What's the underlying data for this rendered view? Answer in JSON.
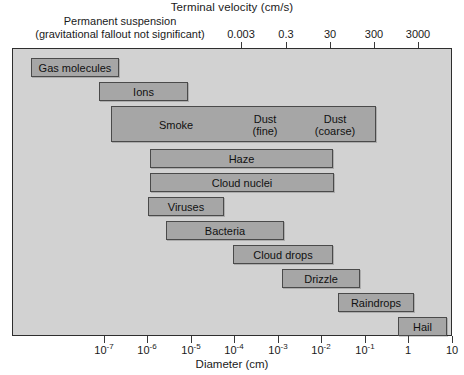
{
  "chart_data": {
    "type": "bar",
    "title": "Terminal velocity (cm/s)",
    "subtitle": "Permanent suspension (gravitational fallout not significant)",
    "xlabel": "Diameter (cm)",
    "ylabel": "",
    "orientation": "horizontal-ranges",
    "grid": false,
    "legend": "none",
    "x_axis_bottom": {
      "label": "Diameter (cm)",
      "scale": "log10",
      "range": [
        -7.5,
        10.0
      ],
      "ticks": [
        {
          "value": 1e-07,
          "label": "10",
          "exponent": "-7"
        },
        {
          "value": 1e-06,
          "label": "10",
          "exponent": "-6"
        },
        {
          "value": 1e-05,
          "label": "10",
          "exponent": "-5"
        },
        {
          "value": 0.0001,
          "label": "10",
          "exponent": "-4"
        },
        {
          "value": 0.001,
          "label": "10",
          "exponent": "-3"
        },
        {
          "value": 0.01,
          "label": "10",
          "exponent": "-2"
        },
        {
          "value": 0.1,
          "label": "10",
          "exponent": "-1"
        },
        {
          "value": 1,
          "label": "1",
          "exponent": ""
        },
        {
          "value": 10,
          "label": "10",
          "exponent": ""
        }
      ]
    },
    "x_axis_top": {
      "label": "Terminal velocity (cm/s)",
      "scale": "log10",
      "ticks": [
        {
          "label": "0.003"
        },
        {
          "label": "0.3"
        },
        {
          "label": "30"
        },
        {
          "label": "300"
        },
        {
          "label": "3000"
        }
      ]
    },
    "categories": [
      "Gas molecules",
      "Ions",
      "Smoke / Dust (fine) / Dust (coarse)",
      "Haze",
      "Cloud nuclei",
      "Viruses",
      "Bacteria",
      "Cloud drops",
      "Drizzle",
      "Raindrops",
      "Hail"
    ],
    "bars": [
      {
        "label": "Gas molecules",
        "d_min": 1e-08,
        "d_max": 4e-07,
        "row": 0
      },
      {
        "label": "Ions",
        "d_min": 2.4e-07,
        "d_max": 1e-05,
        "row": 1
      },
      {
        "label": "Smoke",
        "d_min": 5e-07,
        "d_max": 0.1,
        "row": 2,
        "segments": [
          "Smoke",
          "Dust (fine)",
          "Dust (coarse)"
        ]
      },
      {
        "label": "Haze",
        "d_min": 1e-05,
        "d_max": 0.03,
        "row": 3
      },
      {
        "label": "Cloud nuclei",
        "d_min": 1e-05,
        "d_max": 0.032,
        "row": 4
      },
      {
        "label": "Viruses",
        "d_min": 8e-06,
        "d_max": 0.0001,
        "row": 5
      },
      {
        "label": "Bacteria",
        "d_min": 6e-05,
        "d_max": 0.01,
        "row": 6
      },
      {
        "label": "Cloud drops",
        "d_min": 0.0004,
        "d_max": 0.025,
        "row": 7
      },
      {
        "label": "Drizzle",
        "d_min": 0.01,
        "d_max": 0.25,
        "row": 8
      },
      {
        "label": "Raindrops",
        "d_min": 0.15,
        "d_max": 4.0,
        "row": 9
      },
      {
        "label": "Hail",
        "d_min": 2.0,
        "d_max": 10.0,
        "row": 10
      }
    ]
  },
  "header": {
    "top_title": "Terminal velocity (cm/s)",
    "perm_line1": "Permanent suspension",
    "perm_line2": "(gravitational fallout not significant)"
  },
  "top_axis": {
    "ticks": [
      {
        "label": "0.003",
        "x": 241
      },
      {
        "label": "0.3",
        "x": 286
      },
      {
        "label": "30",
        "x": 330
      },
      {
        "label": "300",
        "x": 374
      },
      {
        "label": "3000",
        "x": 418
      }
    ]
  },
  "bottom_axis": {
    "title": "Diameter (cm)",
    "ticks": [
      {
        "base": "10",
        "exp": "-7",
        "x": 104
      },
      {
        "base": "10",
        "exp": "-6",
        "x": 147
      },
      {
        "base": "10",
        "exp": "-5",
        "x": 191
      },
      {
        "base": "10",
        "exp": "-4",
        "x": 234
      },
      {
        "base": "10",
        "exp": "-3",
        "x": 278
      },
      {
        "base": "10",
        "exp": "-2",
        "x": 321
      },
      {
        "base": "10",
        "exp": "-1",
        "x": 365
      },
      {
        "base": "1",
        "exp": "",
        "x": 408
      },
      {
        "base": "10",
        "exp": "",
        "x": 452
      }
    ]
  },
  "bars": [
    {
      "name": "gas-molecules",
      "label": "Gas molecules",
      "left": 18,
      "width": 88,
      "top": 9,
      "tall": false
    },
    {
      "name": "ions",
      "label": "Ions",
      "left": 86,
      "width": 89,
      "top": 33,
      "tall": false
    },
    {
      "name": "smoke-dust",
      "label": "Smoke",
      "left": 98,
      "width": 265,
      "top": 57,
      "tall": true,
      "segments": [
        {
          "name": "segment-smoke",
          "label": "Smoke",
          "left": 8,
          "width": 112
        },
        {
          "name": "segment-dust-fine",
          "label": "Dust\n(fine)",
          "left": 118,
          "width": 70
        },
        {
          "name": "segment-dust-coarse",
          "label": "Dust\n(coarse)",
          "left": 186,
          "width": 74
        }
      ]
    },
    {
      "name": "haze",
      "label": "Haze",
      "left": 137,
      "width": 183,
      "top": 100,
      "tall": false
    },
    {
      "name": "cloud-nuclei",
      "label": "Cloud nuclei",
      "left": 137,
      "width": 184,
      "top": 124,
      "tall": false
    },
    {
      "name": "viruses",
      "label": "Viruses",
      "left": 135,
      "width": 76,
      "top": 148,
      "tall": false
    },
    {
      "name": "bacteria",
      "label": "Bacteria",
      "left": 153,
      "width": 118,
      "top": 172,
      "tall": false
    },
    {
      "name": "cloud-drops",
      "label": "Cloud drops",
      "left": 220,
      "width": 100,
      "top": 196,
      "tall": false
    },
    {
      "name": "drizzle",
      "label": "Drizzle",
      "left": 269,
      "width": 78,
      "top": 220,
      "tall": false
    },
    {
      "name": "raindrops",
      "label": "Raindrops",
      "left": 325,
      "width": 76,
      "top": 244,
      "tall": false
    },
    {
      "name": "hail",
      "label": "Hail",
      "left": 385,
      "width": 49,
      "top": 268,
      "tall": false
    }
  ]
}
